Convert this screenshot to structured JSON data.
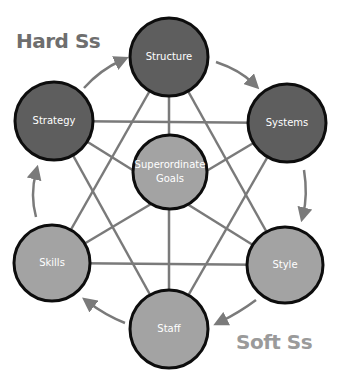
{
  "title_hard": "Hard Ss",
  "title_soft": "Soft Ss",
  "colors": {
    "hard_fill": "#5e5e5e",
    "soft_fill": "#a3a3a3",
    "border": "#0d0d0d",
    "connector": "#7a7a7a",
    "arrow": "#7a7a7a",
    "hard_label": "#6e6e6e",
    "soft_label": "#9a9a9a"
  },
  "nodes": {
    "structure": {
      "label": "Structure",
      "group": "hard"
    },
    "systems": {
      "label": "Systems",
      "group": "hard"
    },
    "strategy": {
      "label": "Strategy",
      "group": "hard"
    },
    "goals": {
      "line1": "Superordinate",
      "line2": "Goals",
      "group": "soft"
    },
    "skills": {
      "label": "Skills",
      "group": "soft"
    },
    "style": {
      "label": "Style",
      "group": "soft"
    },
    "staff": {
      "label": "Staff",
      "group": "soft"
    }
  },
  "cycle_order": [
    "Strategy",
    "Structure",
    "Systems",
    "Style",
    "Staff",
    "Skills"
  ]
}
